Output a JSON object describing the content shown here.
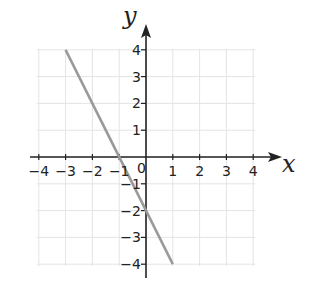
{
  "chart_data": {
    "type": "line",
    "title": "",
    "xlabel": "x",
    "ylabel": "y",
    "xlim": [
      -4,
      4
    ],
    "ylim": [
      -4,
      4
    ],
    "grid": true,
    "x_ticks": [
      -4,
      -3,
      -2,
      -1,
      0,
      1,
      2,
      3,
      4
    ],
    "y_ticks": [
      -4,
      -3,
      -2,
      -1,
      1,
      2,
      3,
      4
    ],
    "x_tick_labels": [
      "−4",
      "−3",
      "−2",
      "−1",
      "1",
      "2",
      "3",
      "4"
    ],
    "y_tick_labels": [
      "4",
      "3",
      "2",
      "1",
      "−1",
      "−2",
      "−3",
      "−4"
    ],
    "origin_label": "0",
    "series": [
      {
        "name": "y = −2x − 2",
        "x": [
          -3,
          1
        ],
        "y": [
          4,
          -4
        ],
        "color": "#9a9a9a"
      }
    ]
  },
  "colors": {
    "axis": "#222222",
    "grid": "#e4e4e4",
    "line": "#9a9a9a"
  }
}
